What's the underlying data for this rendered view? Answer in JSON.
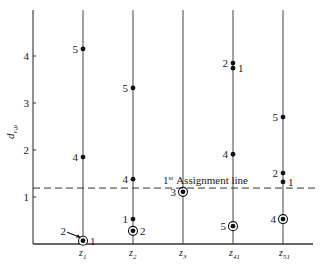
{
  "chart_data": {
    "type": "scatter",
    "title": "",
    "xlabel": "",
    "ylabel": "d_{ν,μ}",
    "ylabel_main": "d",
    "ylabel_sub": "ν,μ",
    "ylim": [
      0,
      4.9
    ],
    "yticks": [
      1,
      2,
      3,
      4
    ],
    "grid": false,
    "columns": [
      {
        "id": "z1",
        "label_main": "z",
        "label_sub": "1",
        "points": [
          {
            "label": "5",
            "y": 4.15,
            "circled": false,
            "label_side": "left"
          },
          {
            "label": "4",
            "y": 1.85,
            "circled": false,
            "label_side": "left"
          },
          {
            "label": "1",
            "y": 0.07,
            "circled": true,
            "label_side": "right"
          },
          {
            "label": "2",
            "y": 0.12,
            "circled": false,
            "label_side": "arrow-left"
          }
        ]
      },
      {
        "id": "z2",
        "label_main": "z",
        "label_sub": "2",
        "points": [
          {
            "label": "5",
            "y": 3.32,
            "circled": false,
            "label_side": "left"
          },
          {
            "label": "4",
            "y": 1.38,
            "circled": false,
            "label_side": "left"
          },
          {
            "label": "1",
            "y": 0.53,
            "circled": false,
            "label_side": "left"
          },
          {
            "label": "2",
            "y": 0.28,
            "circled": true,
            "label_side": "right"
          }
        ]
      },
      {
        "id": "z3",
        "label_main": "z",
        "label_sub": "3",
        "points": [
          {
            "label": "3",
            "y": 1.11,
            "circled": true,
            "label_side": "left"
          }
        ]
      },
      {
        "id": "z41",
        "label_main": "z",
        "label_sub": "41",
        "points": [
          {
            "label": "2",
            "y": 3.85,
            "circled": false,
            "label_side": "left"
          },
          {
            "label": "1",
            "y": 3.74,
            "circled": false,
            "label_side": "right"
          },
          {
            "label": "4",
            "y": 1.91,
            "circled": false,
            "label_side": "left"
          },
          {
            "label": "5",
            "y": 0.38,
            "circled": true,
            "label_side": "left"
          }
        ]
      },
      {
        "id": "z51",
        "label_main": "z",
        "label_sub": "51",
        "points": [
          {
            "label": "5",
            "y": 2.7,
            "circled": false,
            "label_side": "left"
          },
          {
            "label": "2",
            "y": 1.51,
            "circled": false,
            "label_side": "left"
          },
          {
            "label": "1",
            "y": 1.32,
            "circled": false,
            "label_side": "right"
          },
          {
            "label": "4",
            "y": 0.53,
            "circled": true,
            "label_side": "left"
          }
        ]
      }
    ],
    "reference_line": {
      "y": 1.19,
      "style": "dashed",
      "label_sup": "st",
      "label_num": "1",
      "label_text": "Assignment line"
    }
  }
}
